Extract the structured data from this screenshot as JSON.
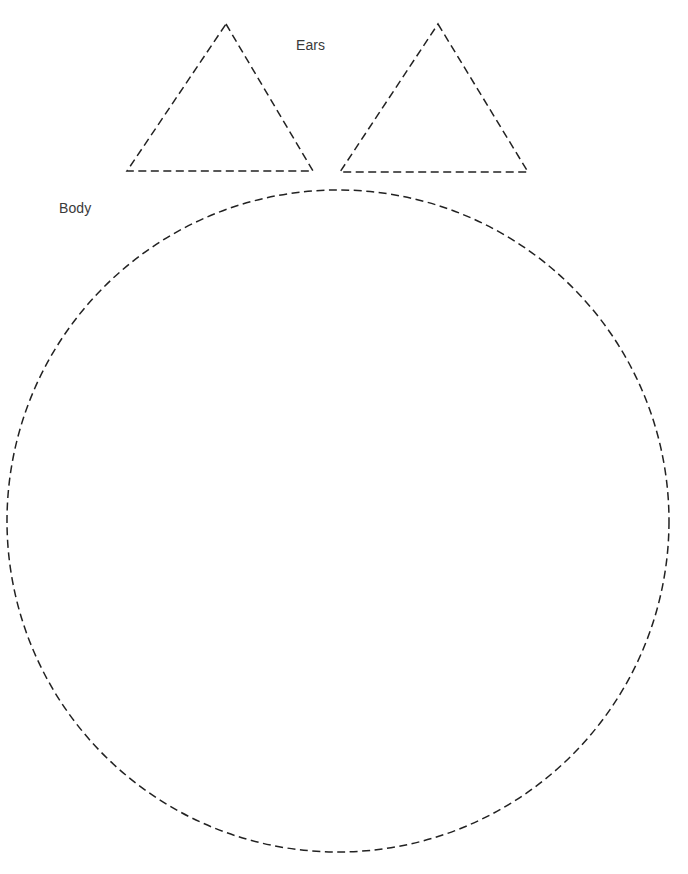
{
  "page": {
    "background_color": "#ffffff",
    "width": 688,
    "height": 874
  },
  "style": {
    "stroke_color": "#222222",
    "stroke_width": 1.5,
    "dash_on": 8,
    "dash_off": 4.5,
    "label_color": "#3a3a3a",
    "label_font_size": 14
  },
  "labels": {
    "ears": "Ears",
    "body": "Body"
  },
  "shapes": {
    "body_circle": {
      "kind": "circle",
      "label": "Body",
      "cx": 338,
      "cy": 521,
      "r": 331
    },
    "left_ear_triangle": {
      "kind": "triangle",
      "label": "Ears",
      "points": "226,24 313,171 127,171"
    },
    "right_ear_triangle": {
      "kind": "triangle",
      "label": "Ears",
      "points": "438,24 528,172 340,172"
    }
  }
}
